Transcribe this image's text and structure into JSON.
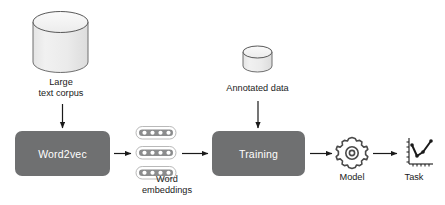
{
  "diagram": {
    "background_color": "#ffffff",
    "box_fill_color": "#6f7071",
    "box_text_color": "#ffffff",
    "shape_outline_color": "#6b6b6b",
    "cylinder_fill_color": "#ededed",
    "arrow_color": "#1a1a1a",
    "nodes": [
      {
        "id": "large-text-corpus",
        "type": "cylinder",
        "label": "Large\ntext corpus"
      },
      {
        "id": "word2vec",
        "type": "process-box",
        "label": "Word2vec"
      },
      {
        "id": "word-embeddings",
        "type": "embedding-vectors",
        "label": "Word\nembeddings",
        "vector_count": 3,
        "cells_per_vector": 4
      },
      {
        "id": "annotated-data",
        "type": "cylinder",
        "label": "Annotated data"
      },
      {
        "id": "training",
        "type": "process-box",
        "label": "Training"
      },
      {
        "id": "model",
        "type": "gear-icon",
        "label": "Model"
      },
      {
        "id": "task",
        "type": "line-chart-icon",
        "label": "Task"
      }
    ],
    "edges": [
      {
        "from": "large-text-corpus",
        "to": "word2vec",
        "direction": "down"
      },
      {
        "from": "word2vec",
        "to": "word-embeddings",
        "direction": "right"
      },
      {
        "from": "word-embeddings",
        "to": "training",
        "direction": "right"
      },
      {
        "from": "annotated-data",
        "to": "training",
        "direction": "down"
      },
      {
        "from": "training",
        "to": "model",
        "direction": "right"
      },
      {
        "from": "model",
        "to": "task",
        "direction": "right"
      }
    ]
  }
}
